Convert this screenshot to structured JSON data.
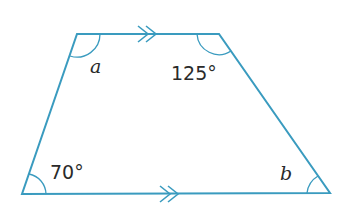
{
  "diagram": {
    "type": "trapezium",
    "stroke_color": "#3a9bbf",
    "vertices": {
      "top_left": [
        77,
        34
      ],
      "top_right": [
        219,
        34
      ],
      "bottom_right": [
        330,
        193
      ],
      "bottom_left": [
        22,
        194
      ]
    },
    "parallel_marks": "double arrow (>>) on top and bottom sides",
    "angles": {
      "top_left": "a",
      "top_right": "125°",
      "bottom_left": "70°",
      "bottom_right": "b"
    }
  }
}
